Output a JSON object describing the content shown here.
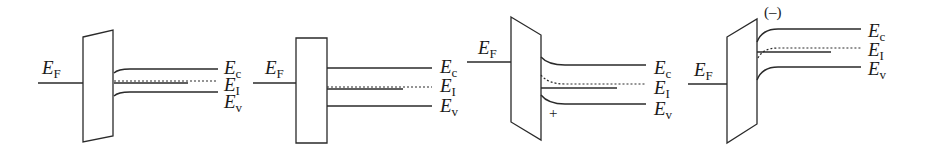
{
  "figure": {
    "colors": {
      "line": "#2a2a2a",
      "background": "#ffffff"
    },
    "panels": [
      {
        "id": "panel-1",
        "fermi_label": {
          "main": "E",
          "sub": "F",
          "x": 42,
          "y": 58
        },
        "fermi_line": [
          38,
          83,
          83,
          83
        ],
        "box": "83,37 113,30 113,136 83,142",
        "ec": "M114,73 Q118,69 130,69 L218,69",
        "ei": "M114,81 L218,81",
        "ef_right": "M114,83 L188,83",
        "ev": "M114,96 Q118,92 130,92 L218,92",
        "labels": [
          {
            "main": "E",
            "sub": "c",
            "x": 224,
            "y": 58
          },
          {
            "main": "E",
            "sub": "I",
            "x": 224,
            "y": 75
          },
          {
            "main": "E",
            "sub": "v",
            "x": 224,
            "y": 92
          }
        ],
        "marker": null
      },
      {
        "id": "panel-2",
        "fermi_label": {
          "main": "E",
          "sub": "F",
          "x": 265,
          "y": 58
        },
        "fermi_line": [
          253,
          83,
          296,
          83
        ],
        "box": "296,38 327,38 327,143 296,143",
        "ec": "M327,68 L432,68",
        "ei": "M327,87 L432,87",
        "ef_right": "M327,89 L403,89",
        "ev": "M327,106 L432,106",
        "labels": [
          {
            "main": "E",
            "sub": "c",
            "x": 440,
            "y": 57
          },
          {
            "main": "E",
            "sub": "I",
            "x": 440,
            "y": 76
          },
          {
            "main": "E",
            "sub": "v",
            "x": 440,
            "y": 96
          }
        ],
        "marker": null
      },
      {
        "id": "panel-3",
        "fermi_label": {
          "main": "E",
          "sub": "F",
          "x": 478,
          "y": 38
        },
        "fermi_line": [
          467,
          62,
          511,
          62
        ],
        "box": "511,17 541,35 541,140 511,122",
        "ec": "M541,57 Q548,65 565,65 L646,65",
        "ei": "M541,75 Q548,84 565,84 L646,84",
        "ef_right": "M541,88 L617,88",
        "ev": "M541,95 Q548,104 565,104 L646,104",
        "labels": [
          {
            "main": "E",
            "sub": "c",
            "x": 654,
            "y": 58
          },
          {
            "main": "E",
            "sub": "I",
            "x": 654,
            "y": 78
          },
          {
            "main": "E",
            "sub": "v",
            "x": 654,
            "y": 99
          }
        ],
        "marker": {
          "text": "+",
          "x": 549,
          "y": 106
        }
      },
      {
        "id": "panel-4",
        "fermi_label": {
          "main": "E",
          "sub": "F",
          "x": 694,
          "y": 60
        },
        "fermi_line": [
          688,
          84,
          727,
          84
        ],
        "box": "727,37 757,19 757,124 727,143",
        "ec": "M757,42 Q762,29 778,29 L861,29",
        "ei": "M758,58 Q763,48 778,48 L861,48",
        "ef_right": "M757,52 L831,52",
        "ev": "M757,80 Q762,67 778,67 L861,67",
        "labels": [
          {
            "main": "E",
            "sub": "c",
            "x": 868,
            "y": 21
          },
          {
            "main": "E",
            "sub": "I",
            "x": 868,
            "y": 40
          },
          {
            "main": "E",
            "sub": "v",
            "x": 868,
            "y": 59
          }
        ],
        "marker": {
          "text": "(–)",
          "x": 764,
          "y": 5
        }
      }
    ]
  }
}
